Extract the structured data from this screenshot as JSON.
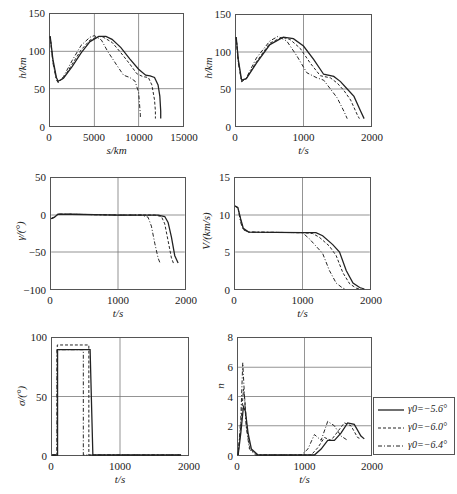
{
  "figure": {
    "legend": {
      "entries": [
        {
          "label": "γ0=−5.6°",
          "style": "solid"
        },
        {
          "label": "γ0=−6.0°",
          "style": "dashed"
        },
        {
          "label": "γ0=−6.4°",
          "style": "dashdot"
        }
      ]
    }
  },
  "chart_data": [
    {
      "id": "h_vs_s",
      "type": "line",
      "title": "",
      "xlabel": "s/km",
      "ylabel": "h/km",
      "xlim": [
        0,
        15000
      ],
      "ylim": [
        0,
        150
      ],
      "xticks": [
        "0",
        "5000",
        "10000",
        "15000"
      ],
      "yticks": [
        "0",
        "50",
        "100",
        "150"
      ],
      "grid": true,
      "series": [
        {
          "name": "γ0=−5.6°",
          "style": "solid",
          "x": [
            0,
            300,
            700,
            900,
            1500,
            2500,
            3500,
            4500,
            5500,
            6300,
            7000,
            8000,
            9000,
            10000,
            10800,
            11300,
            11800,
            12200,
            12400,
            12500,
            12500
          ],
          "y": [
            120,
            90,
            65,
            60,
            64,
            80,
            98,
            113,
            120,
            120,
            116,
            105,
            90,
            76,
            68,
            67,
            65,
            55,
            40,
            20,
            10
          ]
        },
        {
          "name": "γ0=−6.0°",
          "style": "dashed",
          "x": [
            0,
            300,
            700,
            900,
            1500,
            2500,
            3500,
            4500,
            5500,
            6000,
            7000,
            8000,
            9000,
            9800,
            10500,
            11100,
            11500,
            11800,
            11900,
            11900
          ],
          "y": [
            120,
            88,
            63,
            59,
            64,
            83,
            102,
            115,
            120,
            119,
            112,
            98,
            83,
            70,
            66,
            65,
            55,
            35,
            20,
            10
          ]
        },
        {
          "name": "γ0=−6.4°",
          "style": "dashdot",
          "x": [
            0,
            300,
            700,
            900,
            1500,
            2500,
            3500,
            4500,
            5000,
            5800,
            6500,
            7500,
            8300,
            9000,
            9600,
            10000,
            10100,
            10200,
            10200
          ],
          "y": [
            120,
            85,
            62,
            58,
            66,
            88,
            108,
            119,
            121,
            115,
            100,
            82,
            68,
            65,
            60,
            45,
            30,
            15,
            10
          ]
        }
      ]
    },
    {
      "id": "h_vs_t",
      "type": "line",
      "xlabel": "t/s",
      "ylabel": "h/km",
      "xlim": [
        0,
        2000
      ],
      "ylim": [
        0,
        150
      ],
      "xticks": [
        "0",
        "1000",
        "2000"
      ],
      "yticks": [
        "0",
        "50",
        "100",
        "150"
      ],
      "grid": true,
      "series": [
        {
          "name": "γ0=−5.6°",
          "style": "solid",
          "x": [
            0,
            30,
            80,
            150,
            300,
            500,
            700,
            850,
            1000,
            1150,
            1300,
            1450,
            1550,
            1650,
            1750,
            1850,
            1900
          ],
          "y": [
            120,
            90,
            62,
            64,
            85,
            110,
            120,
            118,
            108,
            90,
            70,
            67,
            60,
            50,
            40,
            20,
            10
          ]
        },
        {
          "name": "γ0=−6.0°",
          "style": "dashed",
          "x": [
            0,
            30,
            80,
            150,
            300,
            500,
            680,
            800,
            950,
            1100,
            1250,
            1400,
            1500,
            1600,
            1700,
            1800,
            1830
          ],
          "y": [
            120,
            88,
            60,
            64,
            87,
            112,
            120,
            117,
            105,
            85,
            68,
            65,
            58,
            48,
            35,
            15,
            10
          ]
        },
        {
          "name": "γ0=−6.4°",
          "style": "dashdot",
          "x": [
            0,
            30,
            80,
            150,
            300,
            500,
            620,
            750,
            900,
            1050,
            1200,
            1300,
            1400,
            1500,
            1600,
            1650
          ],
          "y": [
            120,
            85,
            60,
            65,
            92,
            115,
            121,
            115,
            95,
            72,
            65,
            62,
            50,
            38,
            20,
            10
          ]
        }
      ]
    },
    {
      "id": "gamma_vs_t",
      "type": "line",
      "xlabel": "t/s",
      "ylabel": "γ/(°)",
      "xlim": [
        0,
        2000
      ],
      "ylim": [
        -100,
        50
      ],
      "xticks": [
        "0",
        "1000",
        "2000"
      ],
      "yticks": [
        "−100",
        "−50",
        "0",
        "50"
      ],
      "grid": true,
      "series": [
        {
          "name": "γ0=−5.6°",
          "style": "solid",
          "x": [
            0,
            50,
            100,
            300,
            1000,
            1600,
            1700,
            1750,
            1800,
            1850,
            1900
          ],
          "y": [
            -5,
            -3,
            1,
            1,
            0,
            0,
            -2,
            -10,
            -30,
            -55,
            -65
          ]
        },
        {
          "name": "γ0=−6.0°",
          "style": "dashed",
          "x": [
            0,
            50,
            100,
            300,
            1000,
            1550,
            1650,
            1700,
            1750,
            1800,
            1830
          ],
          "y": [
            -5,
            -3,
            1,
            1,
            0,
            0,
            -2,
            -12,
            -35,
            -58,
            -65
          ]
        },
        {
          "name": "γ0=−6.4°",
          "style": "dashdot",
          "x": [
            0,
            50,
            100,
            300,
            1000,
            1350,
            1450,
            1500,
            1550,
            1600,
            1630
          ],
          "y": [
            -5,
            -3,
            1,
            1,
            0,
            0,
            -3,
            -15,
            -38,
            -58,
            -65
          ]
        }
      ]
    },
    {
      "id": "V_vs_t",
      "type": "line",
      "xlabel": "t/s",
      "ylabel": "V/(km/s)",
      "xlim": [
        0,
        2000
      ],
      "ylim": [
        0,
        15
      ],
      "xticks": [
        "0",
        "1000",
        "2000"
      ],
      "yticks": [
        "0",
        "5",
        "10",
        "15"
      ],
      "grid": true,
      "series": [
        {
          "name": "γ0=−5.6°",
          "style": "solid",
          "x": [
            0,
            40,
            80,
            120,
            200,
            1000,
            1200,
            1300,
            1450,
            1550,
            1650,
            1750,
            1850,
            1920
          ],
          "y": [
            11.2,
            11,
            9.5,
            8.2,
            7.7,
            7.6,
            7.6,
            7.2,
            6.0,
            5.0,
            2.5,
            0.8,
            0.2,
            0
          ]
        },
        {
          "name": "γ0=−6.0°",
          "style": "dashed",
          "x": [
            0,
            40,
            80,
            120,
            200,
            1000,
            1150,
            1250,
            1400,
            1500,
            1600,
            1700,
            1800,
            1870
          ],
          "y": [
            11.2,
            11,
            9.3,
            8.1,
            7.7,
            7.6,
            7.5,
            7.0,
            5.8,
            4.5,
            2.2,
            0.7,
            0.1,
            0
          ]
        },
        {
          "name": "γ0=−6.4°",
          "style": "dashdot",
          "x": [
            0,
            40,
            80,
            120,
            200,
            1000,
            1100,
            1200,
            1300,
            1400,
            1500,
            1600,
            1650
          ],
          "y": [
            11.2,
            11,
            9.0,
            8.0,
            7.7,
            7.6,
            6.8,
            5.8,
            4.8,
            2.5,
            0.8,
            0.1,
            0
          ]
        }
      ]
    },
    {
      "id": "sigma_vs_t",
      "type": "line",
      "xlabel": "t/s",
      "ylabel": "σ/(°)",
      "xlim": [
        0,
        2000
      ],
      "ylim": [
        0,
        100
      ],
      "xticks": [
        "0",
        "1000",
        "2000"
      ],
      "yticks": [
        "0",
        "50",
        "100"
      ],
      "grid": true,
      "series": [
        {
          "name": "γ0=−5.6°",
          "style": "solid",
          "x": [
            0,
            80,
            80,
            560,
            600,
            1900
          ],
          "y": [
            0,
            0,
            90,
            90,
            0,
            0
          ]
        },
        {
          "name": "γ0=−6.0°",
          "style": "dashed",
          "x": [
            0,
            75,
            75,
            540,
            540,
            1900
          ],
          "y": [
            0,
            0,
            94,
            94,
            0,
            0
          ]
        },
        {
          "name": "γ0=−6.4°",
          "style": "dashdot",
          "x": [
            0,
            70,
            70,
            460,
            460,
            1900
          ],
          "y": [
            0,
            0,
            90,
            90,
            0,
            0
          ]
        }
      ]
    },
    {
      "id": "n_vs_t",
      "type": "line",
      "xlabel": "t/s",
      "ylabel": "n",
      "xlim": [
        0,
        2000
      ],
      "ylim": [
        0,
        8
      ],
      "xticks": [
        "0",
        "1000",
        "2000"
      ],
      "yticks": [
        "0",
        "2",
        "4",
        "6",
        "8"
      ],
      "grid": true,
      "series": [
        {
          "name": "γ0=−5.6°",
          "style": "solid",
          "x": [
            0,
            40,
            80,
            110,
            150,
            200,
            300,
            1000,
            1150,
            1250,
            1350,
            1450,
            1550,
            1650,
            1750,
            1850,
            1900
          ],
          "y": [
            0,
            1.5,
            3.3,
            3.0,
            1.5,
            0.4,
            0,
            0,
            0,
            0.4,
            1.0,
            1.0,
            1.5,
            2.2,
            2.1,
            1.3,
            1.1
          ]
        },
        {
          "name": "γ0=−6.0°",
          "style": "dashed",
          "x": [
            0,
            40,
            80,
            100,
            130,
            180,
            280,
            1000,
            1100,
            1200,
            1300,
            1400,
            1500,
            1600,
            1700,
            1800,
            1850
          ],
          "y": [
            0,
            2,
            4.5,
            3.8,
            1.8,
            0.4,
            0,
            0,
            0,
            0.5,
            1.2,
            1.0,
            1.6,
            2.2,
            2.0,
            1.2,
            1.1
          ]
        },
        {
          "name": "γ0=−6.4°",
          "style": "dashdot",
          "x": [
            0,
            40,
            70,
            90,
            120,
            170,
            260,
            950,
            1050,
            1150,
            1250,
            1350,
            1450,
            1550,
            1650
          ],
          "y": [
            0,
            2.5,
            6.3,
            4.5,
            2.0,
            0.4,
            0,
            0,
            0.4,
            1.4,
            1.0,
            2.3,
            2.0,
            1.3,
            1.0
          ]
        }
      ]
    }
  ]
}
